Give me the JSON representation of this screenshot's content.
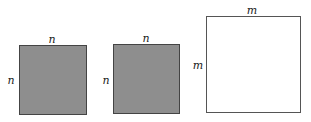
{
  "diagram": {
    "squares": [
      {
        "id": "square-n-1",
        "fill": "#8e8e8e",
        "side_label_top": "n",
        "side_label_left": "n"
      },
      {
        "id": "square-n-2",
        "fill": "#8e8e8e",
        "side_label_top": "n",
        "side_label_left": "n"
      },
      {
        "id": "square-m",
        "fill": "#ffffff",
        "side_label_top": "m",
        "side_label_left": "m"
      }
    ]
  }
}
